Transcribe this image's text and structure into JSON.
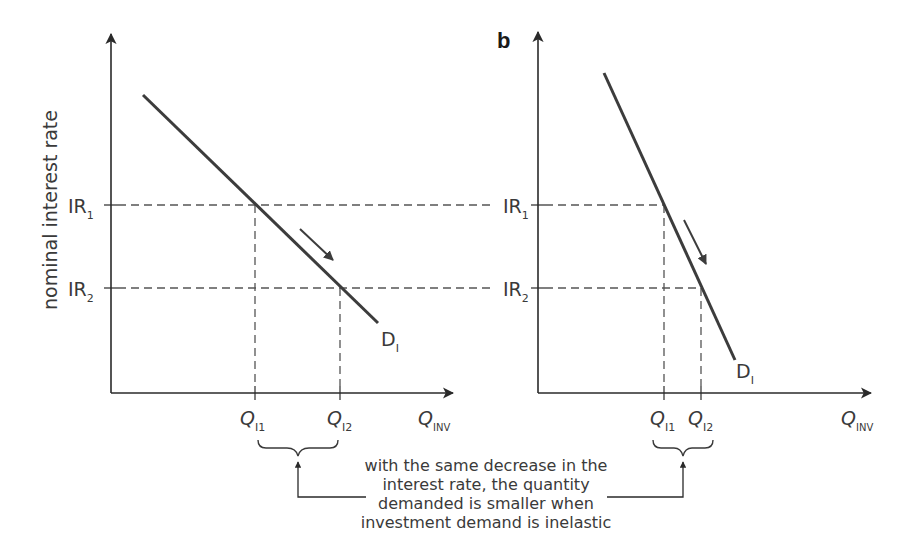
{
  "figure": {
    "panel_letter": "b",
    "y_axis_label": "nominal interest rate",
    "colors": {
      "axis": "#2a2a2a",
      "demand_curve": "#3c3c3c",
      "dashed": "#555555",
      "text": "#3a3a3a"
    },
    "panels": [
      {
        "id": "elastic",
        "y_ticks": [
          {
            "label": "IR",
            "sub": "1"
          },
          {
            "label": "IR",
            "sub": "2"
          }
        ],
        "x_ticks": [
          {
            "label": "Q",
            "sub": "I1"
          },
          {
            "label": "Q",
            "sub": "I2"
          }
        ],
        "x_axis_label": {
          "label": "Q",
          "sub": "INV"
        },
        "curve_label": {
          "label": "D",
          "sub": "I"
        }
      },
      {
        "id": "inelastic",
        "y_ticks": [
          {
            "label": "IR",
            "sub": "1"
          },
          {
            "label": "IR",
            "sub": "2"
          }
        ],
        "x_ticks": [
          {
            "label": "Q",
            "sub": "I1"
          },
          {
            "label": "Q",
            "sub": "I2"
          }
        ],
        "x_axis_label": {
          "label": "Q",
          "sub": "INV"
        },
        "curve_label": {
          "label": "D",
          "sub": "I"
        }
      }
    ],
    "annotation": {
      "lines": [
        "with the same decrease in the",
        "interest rate, the quantity",
        "demanded is smaller when",
        "investment demand is inelastic"
      ]
    }
  }
}
